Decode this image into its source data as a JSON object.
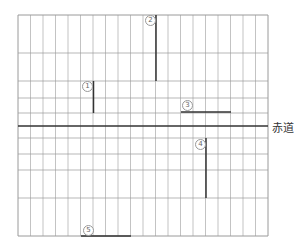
{
  "diagram": {
    "type": "map-grid",
    "equator_label": "赤道",
    "grid": {
      "left": 18,
      "right": 268,
      "top": 15,
      "bottom": 236,
      "columns": 20,
      "horizontal_lines": [
        15,
        53,
        81,
        98,
        113,
        126,
        138,
        154,
        170,
        198,
        236
      ],
      "equator_y": 126
    },
    "segments": [
      {
        "id": "1",
        "label": "①",
        "orientation": "vertical",
        "x1": 93.5,
        "y1": 81,
        "x2": 93.5,
        "y2": 113,
        "label_x": 82,
        "label_y": 81
      },
      {
        "id": "2",
        "label": "②",
        "orientation": "vertical",
        "x1": 156,
        "y1": 15,
        "x2": 156,
        "y2": 81,
        "label_x": 145,
        "label_y": 15
      },
      {
        "id": "3",
        "label": "③",
        "orientation": "horizontal",
        "x1": 181,
        "y1": 112,
        "x2": 231,
        "y2": 112,
        "label_x": 182,
        "label_y": 100
      },
      {
        "id": "4",
        "label": "④",
        "orientation": "vertical",
        "x1": 206,
        "y1": 138,
        "x2": 206,
        "y2": 198,
        "label_x": 195,
        "label_y": 139
      },
      {
        "id": "5",
        "label": "⑤",
        "orientation": "horizontal",
        "x1": 81,
        "y1": 236,
        "x2": 131,
        "y2": 236,
        "label_x": 83,
        "label_y": 225
      }
    ],
    "colors": {
      "grid": "#9a9a9a",
      "equator": "#333333",
      "segment": "#333333",
      "label": "#777777"
    }
  }
}
